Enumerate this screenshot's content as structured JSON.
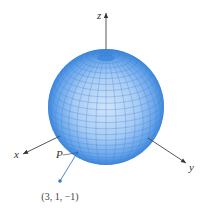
{
  "figure": {
    "type": "3d-sphere-diagram",
    "sphere": {
      "center": [
        106,
        107
      ],
      "radius": 58,
      "fill_center": "#cfe2f8",
      "fill_mid": "#8fbdf0",
      "fill_edge": "#4a90e2",
      "grid_color": "#3f86da",
      "latitude_lines": 28,
      "longitude_lines": 36,
      "tilt_deg": 22
    },
    "axes": {
      "color": "#444444",
      "z": {
        "label": "z",
        "from": [
          106,
          49
        ],
        "to": [
          106,
          13
        ],
        "label_pos": [
          97,
          19
        ]
      },
      "x": {
        "label": "x",
        "from": [
          60,
          136
        ],
        "to": [
          23,
          154
        ],
        "label_pos": [
          14,
          158
        ]
      },
      "y": {
        "label": "y",
        "from": [
          148,
          138
        ],
        "to": [
          186,
          163
        ],
        "label_pos": [
          189,
          171
        ]
      }
    },
    "point": {
      "label": "P",
      "label_pos": [
        56,
        158
      ],
      "on_sphere": [
        77,
        153
      ],
      "external_point": [
        60,
        181
      ],
      "external_label": "(3, 1, −1)",
      "external_label_pos": [
        60,
        200
      ],
      "color": "#3a78c8"
    }
  }
}
